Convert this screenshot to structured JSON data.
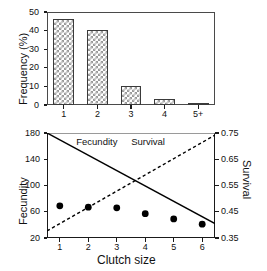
{
  "figure": {
    "background": "#ffffff",
    "foreground": "#000000"
  },
  "panels": [
    {
      "id": "top",
      "name": "clutch-size-frequency-panel"
    },
    {
      "id": "bottom",
      "name": "fecundity-survival-panel"
    }
  ],
  "chart_data": [
    {
      "type": "bar",
      "title": "",
      "xlabel": "",
      "ylabel": "Frequency (%)",
      "categories": [
        "1",
        "2",
        "3",
        "4",
        "5+"
      ],
      "values": [
        46.5,
        40.5,
        10.0,
        3.0,
        1.2
      ],
      "ylim": [
        0,
        50
      ],
      "yticks": [
        0,
        10,
        20,
        30,
        40,
        50
      ],
      "ytick_labels": [
        "0",
        "10",
        "20",
        "30",
        "40",
        "50"
      ],
      "grid": false,
      "legend": null,
      "bar_fill": "checkerboard-hatch",
      "bar_edge_color": "#3a3a3a"
    },
    {
      "type": "line",
      "title": "",
      "xlabel": "Clutch size",
      "ylabel": "Fecundity",
      "ylabel_right": "Survival",
      "x": [
        1,
        2,
        3,
        4,
        5,
        6
      ],
      "xtick_labels": [
        "1",
        "2",
        "3",
        "4",
        "5",
        "6"
      ],
      "xlim": [
        0.55,
        6.45
      ],
      "ylim": [
        20,
        180
      ],
      "yticks": [
        20,
        60,
        100,
        140,
        180
      ],
      "ytick_labels": [
        "20",
        "60",
        "100",
        "140",
        "180"
      ],
      "ylim_right": [
        0.35,
        0.75
      ],
      "yticks_right": [
        0.35,
        0.45,
        0.55,
        0.65,
        0.75
      ],
      "ytick_labels_right": [
        "0.35",
        "0.45",
        "0.55",
        "0.65",
        "0.75"
      ],
      "grid": false,
      "legend": "in-plot annotations",
      "series": [
        {
          "name": "Fecundity",
          "style": "solid-line",
          "axis": "left",
          "color": "#000000",
          "x_endpoints": [
            0.55,
            6.45
          ],
          "y_endpoints": [
            180,
            42
          ]
        },
        {
          "name": "Survival",
          "style": "dashed-line",
          "axis": "right",
          "color": "#000000",
          "x_endpoints": [
            0.55,
            6.45
          ],
          "y_endpoints": [
            0.377,
            0.742
          ]
        },
        {
          "name": "Observed clutch-size fitness points",
          "style": "filled-circle-markers",
          "axis": "left",
          "color": "#000000",
          "values": [
            69,
            67,
            66,
            57,
            49,
            41
          ]
        }
      ],
      "annotations": [
        {
          "text": "Fecundity",
          "x": 2.3,
          "y": 166
        },
        {
          "text": "Survival",
          "x": 4.1,
          "y": 166
        }
      ]
    }
  ]
}
